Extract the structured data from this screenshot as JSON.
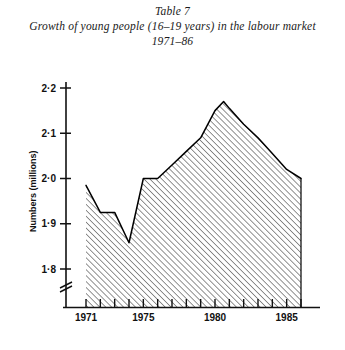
{
  "figure": {
    "table_label": "Table 7",
    "title_line_1": "Growth of young people (16–19 years) in the labour market",
    "title_line_2": "1971–86"
  },
  "axes": {
    "y_axis_title": "Numbers (millions)",
    "y_tick_labels": [
      "2·2",
      "2·1",
      "2·0",
      "1·9",
      "1·8"
    ],
    "y_tick_values": [
      2.2,
      2.1,
      2.0,
      1.9,
      1.8
    ],
    "x_tick_labels": [
      "1971",
      "1975",
      "1980",
      "1985"
    ],
    "x_tick_values": [
      1971,
      1975,
      1980,
      1985
    ],
    "axis_break_symbol": "broken-axis-mark"
  },
  "colors": {
    "axis": "#111111",
    "curve": "#000000",
    "hatch": "#444444",
    "background": "#ffffff"
  },
  "chart_data": {
    "type": "area",
    "title": "Growth of young people (16–19 years) in the labour market 1971–86",
    "subtitle": "Table 7",
    "xlabel": "",
    "ylabel": "Numbers (millions)",
    "xlim": [
      1971,
      1986
    ],
    "ylim": [
      1.75,
      2.22
    ],
    "y_axis_broken_below": 1.8,
    "grid": false,
    "legend": "none",
    "fill_pattern": "diagonal-hatch",
    "x": [
      1971,
      1972,
      1973,
      1974,
      1975,
      1976,
      1977,
      1978,
      1979,
      1980,
      1980.6,
      1981,
      1982,
      1983,
      1984,
      1985,
      1986
    ],
    "values": [
      1.985,
      1.925,
      1.925,
      1.858,
      2.0,
      2.0,
      2.03,
      2.06,
      2.09,
      2.15,
      2.17,
      2.155,
      2.12,
      2.09,
      2.055,
      2.02,
      2.0
    ],
    "annotations": [
      {
        "label": "start",
        "x": 1971,
        "y": 1.985
      },
      {
        "label": "plateau",
        "x": 1972,
        "y": 1.925
      },
      {
        "label": "trough",
        "x": 1974,
        "y": 1.858
      },
      {
        "label": "shoulder",
        "x": 1975,
        "y": 2.0
      },
      {
        "label": "peak",
        "x": 1980.6,
        "y": 2.17
      },
      {
        "label": "end",
        "x": 1986,
        "y": 2.0
      }
    ]
  }
}
